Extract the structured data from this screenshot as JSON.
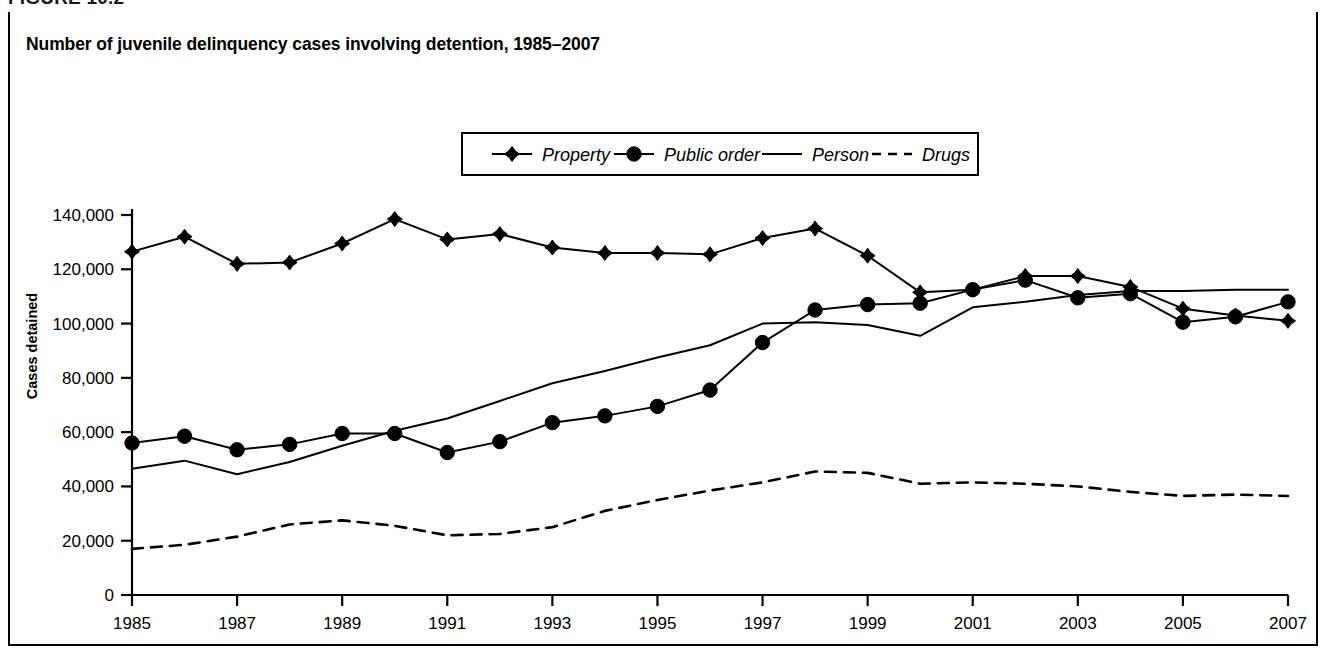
{
  "figure": {
    "label": "FIGURE 10.2",
    "title": "Number of juvenile delinquency cases involving detention, 1985–2007"
  },
  "colors": {
    "ink": "#000000",
    "line": "#1a1a1a",
    "background": "#ffffff"
  },
  "chart_data": {
    "type": "line",
    "title": "Number of juvenile delinquency cases involving detention, 1985–2007",
    "xlabel": "",
    "ylabel": "Cases detained",
    "xlim": [
      1985,
      2007
    ],
    "ylim": [
      0,
      140000
    ],
    "ytick_values": [
      0,
      20000,
      40000,
      60000,
      80000,
      100000,
      120000,
      140000
    ],
    "ytick_labels": [
      "0",
      "20,000",
      "40,000",
      "60,000",
      "80,000",
      "100,000",
      "120,000",
      "140,000"
    ],
    "xtick_values": [
      1985,
      1987,
      1989,
      1991,
      1993,
      1995,
      1997,
      1999,
      2001,
      2003,
      2005,
      2007
    ],
    "xtick_labels": [
      "1985",
      "1987",
      "1989",
      "1991",
      "1993",
      "1995",
      "1997",
      "1999",
      "2001",
      "2003",
      "2005",
      "2007"
    ],
    "grid": false,
    "legend_position": "top-center",
    "x": [
      1985,
      1986,
      1987,
      1988,
      1989,
      1990,
      1991,
      1992,
      1993,
      1994,
      1995,
      1996,
      1997,
      1998,
      1999,
      2000,
      2001,
      2002,
      2003,
      2004,
      2005,
      2006,
      2007
    ],
    "series": [
      {
        "name": "Property",
        "marker": "diamond",
        "dash": "solid",
        "values": [
          126500,
          132000,
          122000,
          122500,
          129500,
          138500,
          131000,
          133000,
          128000,
          126000,
          126000,
          125500,
          131500,
          135000,
          125000,
          111500,
          112500,
          117500,
          117500,
          113500,
          105500,
          103000,
          101000
        ]
      },
      {
        "name": "Public order",
        "marker": "circle",
        "dash": "solid",
        "values": [
          56000,
          58500,
          53500,
          55500,
          59500,
          59500,
          52500,
          56500,
          63500,
          66000,
          69500,
          75500,
          93000,
          105000,
          107000,
          107500,
          112500,
          116000,
          109500,
          111000,
          100500,
          102500,
          108000
        ]
      },
      {
        "name": "Person",
        "marker": "none",
        "dash": "solid",
        "values": [
          46500,
          49500,
          44500,
          49000,
          55000,
          60500,
          65000,
          71500,
          78000,
          82500,
          87500,
          92000,
          100000,
          100500,
          99500,
          95500,
          106000,
          108000,
          110500,
          112000,
          112000,
          112500,
          112500
        ]
      },
      {
        "name": "Drugs",
        "marker": "none",
        "dash": "dashed",
        "values": [
          17000,
          18500,
          21500,
          26000,
          27500,
          25500,
          22000,
          22500,
          25000,
          31000,
          35000,
          38500,
          41500,
          45500,
          45000,
          41000,
          41500,
          41000,
          40000,
          38000,
          36500,
          37000,
          36500
        ]
      }
    ],
    "legend": [
      {
        "label": "Property",
        "marker": "diamond",
        "dash": "solid"
      },
      {
        "label": "Public order",
        "marker": "circle",
        "dash": "solid"
      },
      {
        "label": "Person",
        "marker": "none",
        "dash": "solid"
      },
      {
        "label": "Drugs",
        "marker": "none",
        "dash": "dashed"
      }
    ]
  }
}
